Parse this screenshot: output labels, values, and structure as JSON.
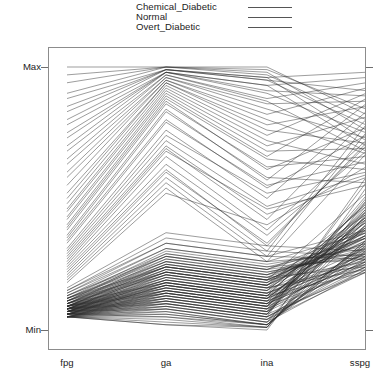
{
  "legend": {
    "position": "top-center",
    "entries": [
      {
        "label": "Chemical_Diabetic",
        "color": "#555555",
        "style": "solid"
      },
      {
        "label": "Normal",
        "color": "#555555",
        "style": "solid"
      },
      {
        "label": "Overt_Diabetic",
        "color": "#555555",
        "style": "solid"
      }
    ]
  },
  "axes": {
    "y_max_label": "Max",
    "y_min_label": "Min"
  },
  "chart_data": {
    "type": "line",
    "subtype": "parallel-coordinates",
    "title": "",
    "xlabel": "",
    "ylabel": "",
    "grid": false,
    "legend_position": "top",
    "axis_names": [
      "fpg",
      "ga",
      "ina",
      "sspg"
    ],
    "axis_tick_labels": [
      "Min",
      "Max"
    ],
    "ylim": [
      0,
      1
    ],
    "value_scaling": "each axis normalized from Min to Max",
    "series_groups": [
      "Chemical_Diabetic",
      "Normal",
      "Overt_Diabetic"
    ],
    "line_color": "#2b2b2b",
    "line_width": 0.55,
    "n_lines": 145,
    "values": [
      [
        0.08,
        0.22,
        0.17,
        0.34
      ],
      [
        0.07,
        0.19,
        0.14,
        0.29
      ],
      [
        0.06,
        0.17,
        0.12,
        0.41
      ],
      [
        0.09,
        0.24,
        0.19,
        0.26
      ],
      [
        0.05,
        0.15,
        0.1,
        0.38
      ],
      [
        0.1,
        0.26,
        0.21,
        0.31
      ],
      [
        0.07,
        0.2,
        0.15,
        0.45
      ],
      [
        0.06,
        0.18,
        0.13,
        0.22
      ],
      [
        0.08,
        0.23,
        0.18,
        0.36
      ],
      [
        0.11,
        0.28,
        0.23,
        0.28
      ],
      [
        0.05,
        0.14,
        0.09,
        0.43
      ],
      [
        0.09,
        0.25,
        0.2,
        0.33
      ],
      [
        0.07,
        0.21,
        0.16,
        0.25
      ],
      [
        0.06,
        0.16,
        0.11,
        0.39
      ],
      [
        0.1,
        0.27,
        0.22,
        0.3
      ],
      [
        0.08,
        0.22,
        0.17,
        0.47
      ],
      [
        0.05,
        0.13,
        0.08,
        0.24
      ],
      [
        0.09,
        0.24,
        0.19,
        0.35
      ],
      [
        0.07,
        0.19,
        0.14,
        0.27
      ],
      [
        0.06,
        0.17,
        0.12,
        0.42
      ],
      [
        0.11,
        0.29,
        0.24,
        0.32
      ],
      [
        0.08,
        0.21,
        0.16,
        0.23
      ],
      [
        0.05,
        0.12,
        0.07,
        0.4
      ],
      [
        0.1,
        0.25,
        0.2,
        0.37
      ],
      [
        0.07,
        0.18,
        0.13,
        0.29
      ],
      [
        0.09,
        0.23,
        0.18,
        0.44
      ],
      [
        0.06,
        0.15,
        0.1,
        0.26
      ],
      [
        0.08,
        0.2,
        0.15,
        0.34
      ],
      [
        0.12,
        0.3,
        0.25,
        0.31
      ],
      [
        0.05,
        0.11,
        0.06,
        0.46
      ],
      [
        0.07,
        0.17,
        0.12,
        0.28
      ],
      [
        0.09,
        0.22,
        0.17,
        0.38
      ],
      [
        0.06,
        0.14,
        0.09,
        0.24
      ],
      [
        0.1,
        0.24,
        0.19,
        0.36
      ],
      [
        0.08,
        0.19,
        0.14,
        0.43
      ],
      [
        0.05,
        0.1,
        0.05,
        0.27
      ],
      [
        0.11,
        0.26,
        0.21,
        0.33
      ],
      [
        0.07,
        0.16,
        0.11,
        0.25
      ],
      [
        0.09,
        0.21,
        0.16,
        0.41
      ],
      [
        0.06,
        0.13,
        0.08,
        0.3
      ],
      [
        0.08,
        0.18,
        0.13,
        0.48
      ],
      [
        0.12,
        0.28,
        0.23,
        0.35
      ],
      [
        0.05,
        0.09,
        0.04,
        0.22
      ],
      [
        0.1,
        0.23,
        0.18,
        0.39
      ],
      [
        0.07,
        0.15,
        0.1,
        0.26
      ],
      [
        0.09,
        0.2,
        0.15,
        0.44
      ],
      [
        0.06,
        0.12,
        0.07,
        0.32
      ],
      [
        0.08,
        0.17,
        0.12,
        0.28
      ],
      [
        0.13,
        0.31,
        0.26,
        0.37
      ],
      [
        0.05,
        0.08,
        0.03,
        0.45
      ],
      [
        0.11,
        0.25,
        0.2,
        0.24
      ],
      [
        0.07,
        0.14,
        0.09,
        0.4
      ],
      [
        0.09,
        0.19,
        0.14,
        0.31
      ],
      [
        0.06,
        0.11,
        0.06,
        0.5
      ],
      [
        0.08,
        0.16,
        0.11,
        0.27
      ],
      [
        0.1,
        0.22,
        0.17,
        0.42
      ],
      [
        0.05,
        0.07,
        0.02,
        0.34
      ],
      [
        0.12,
        0.27,
        0.22,
        0.29
      ],
      [
        0.07,
        0.13,
        0.08,
        0.47
      ],
      [
        0.09,
        0.18,
        0.13,
        0.36
      ],
      [
        0.06,
        0.1,
        0.05,
        0.23
      ],
      [
        0.08,
        0.15,
        0.1,
        0.43
      ],
      [
        0.14,
        0.33,
        0.28,
        0.38
      ],
      [
        0.05,
        0.06,
        0.02,
        0.3
      ],
      [
        0.11,
        0.24,
        0.19,
        0.52
      ],
      [
        0.07,
        0.12,
        0.07,
        0.25
      ],
      [
        0.09,
        0.17,
        0.12,
        0.41
      ],
      [
        0.06,
        0.09,
        0.04,
        0.33
      ],
      [
        0.08,
        0.14,
        0.09,
        0.49
      ],
      [
        0.13,
        0.29,
        0.24,
        0.27
      ],
      [
        0.05,
        0.05,
        0.01,
        0.44
      ],
      [
        0.1,
        0.21,
        0.16,
        0.35
      ],
      [
        0.07,
        0.11,
        0.06,
        0.22
      ],
      [
        0.09,
        0.16,
        0.11,
        0.46
      ],
      [
        0.06,
        0.08,
        0.03,
        0.31
      ],
      [
        0.08,
        0.13,
        0.08,
        0.39
      ],
      [
        0.15,
        0.35,
        0.3,
        0.28
      ],
      [
        0.05,
        0.04,
        0.01,
        0.54
      ],
      [
        0.12,
        0.26,
        0.21,
        0.37
      ],
      [
        0.07,
        0.1,
        0.05,
        0.24
      ],
      [
        0.09,
        0.15,
        0.1,
        0.43
      ],
      [
        0.06,
        0.07,
        0.02,
        0.32
      ],
      [
        0.08,
        0.12,
        0.07,
        0.51
      ],
      [
        0.14,
        0.31,
        0.26,
        0.29
      ],
      [
        0.05,
        0.03,
        0.01,
        0.4
      ],
      [
        0.11,
        0.22,
        0.17,
        0.36
      ],
      [
        0.07,
        0.09,
        0.04,
        0.26
      ],
      [
        0.1,
        0.18,
        0.13,
        0.48
      ],
      [
        0.06,
        0.06,
        0.02,
        0.34
      ],
      [
        0.08,
        0.11,
        0.06,
        0.56
      ],
      [
        0.16,
        0.37,
        0.32,
        0.3
      ],
      [
        0.05,
        0.02,
        0.01,
        0.42
      ],
      [
        0.13,
        0.28,
        0.23,
        0.38
      ],
      [
        0.07,
        0.08,
        0.03,
        0.23
      ],
      [
        0.09,
        0.14,
        0.09,
        0.45
      ],
      [
        0.06,
        0.05,
        0.02,
        0.33
      ],
      [
        0.08,
        0.1,
        0.05,
        0.58
      ],
      [
        0.15,
        0.33,
        0.28,
        0.27
      ],
      [
        0.05,
        0.02,
        0.0,
        0.49
      ],
      [
        0.12,
        0.24,
        0.19,
        0.35
      ],
      [
        0.18,
        0.52,
        0.4,
        0.62
      ],
      [
        0.22,
        0.6,
        0.33,
        0.7
      ],
      [
        0.26,
        0.68,
        0.46,
        0.55
      ],
      [
        0.2,
        0.56,
        0.28,
        0.75
      ],
      [
        0.3,
        0.74,
        0.52,
        0.6
      ],
      [
        0.24,
        0.63,
        0.36,
        0.68
      ],
      [
        0.28,
        0.7,
        0.44,
        0.58
      ],
      [
        0.21,
        0.58,
        0.3,
        0.78
      ],
      [
        0.33,
        0.79,
        0.55,
        0.64
      ],
      [
        0.25,
        0.66,
        0.38,
        0.72
      ],
      [
        0.19,
        0.54,
        0.26,
        0.67
      ],
      [
        0.35,
        0.83,
        0.58,
        0.56
      ],
      [
        0.27,
        0.69,
        0.42,
        0.8
      ],
      [
        0.23,
        0.61,
        0.32,
        0.71
      ],
      [
        0.38,
        0.86,
        0.62,
        0.66
      ],
      [
        0.29,
        0.72,
        0.47,
        0.59
      ],
      [
        0.31,
        0.76,
        0.5,
        0.83
      ],
      [
        0.4,
        0.88,
        0.65,
        0.61
      ],
      [
        0.34,
        0.8,
        0.54,
        0.74
      ],
      [
        0.43,
        0.9,
        0.68,
        0.69
      ],
      [
        0.36,
        0.84,
        0.57,
        0.86
      ],
      [
        0.46,
        0.92,
        0.72,
        0.63
      ],
      [
        0.39,
        0.87,
        0.61,
        0.77
      ],
      [
        0.5,
        0.94,
        0.76,
        0.71
      ],
      [
        0.42,
        0.89,
        0.66,
        0.88
      ],
      [
        0.55,
        0.95,
        0.8,
        0.67
      ],
      [
        0.45,
        0.91,
        0.7,
        0.81
      ],
      [
        0.6,
        0.96,
        0.84,
        0.73
      ],
      [
        0.48,
        0.93,
        0.74,
        0.9
      ],
      [
        0.65,
        0.97,
        0.87,
        0.68
      ],
      [
        0.52,
        0.94,
        0.78,
        0.85
      ],
      [
        0.7,
        0.98,
        0.9,
        0.75
      ],
      [
        0.58,
        0.95,
        0.82,
        0.92
      ],
      [
        0.75,
        0.98,
        0.93,
        0.7
      ],
      [
        0.63,
        0.96,
        0.86,
        0.87
      ],
      [
        0.8,
        0.99,
        0.95,
        0.78
      ],
      [
        0.68,
        0.97,
        0.88,
        0.94
      ],
      [
        0.85,
        0.99,
        0.96,
        0.72
      ],
      [
        0.73,
        0.98,
        0.91,
        0.89
      ],
      [
        0.9,
        1.0,
        0.97,
        0.8
      ],
      [
        0.78,
        0.98,
        0.93,
        0.96
      ],
      [
        0.94,
        1.0,
        0.98,
        0.76
      ],
      [
        0.83,
        0.99,
        0.95,
        0.91
      ],
      [
        0.97,
        1.0,
        0.99,
        0.84
      ],
      [
        0.88,
        0.99,
        0.96,
        0.98
      ],
      [
        1.0,
        1.0,
        1.0,
        0.82
      ]
    ]
  }
}
